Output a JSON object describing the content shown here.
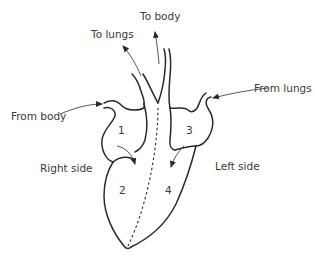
{
  "diagram": {
    "labels": {
      "to_body": "To body",
      "to_lungs": "To lungs",
      "from_body": "From body",
      "from_lungs": "From lungs",
      "right_side": "Right side",
      "left_side": "Left side"
    },
    "chambers": [
      {
        "id": "1",
        "label": "1"
      },
      {
        "id": "2",
        "label": "2"
      },
      {
        "id": "3",
        "label": "3"
      },
      {
        "id": "4",
        "label": "4"
      }
    ],
    "colors": {
      "stroke": "#2a2a2a",
      "arrow": "#555555",
      "text": "#3a3a3a"
    }
  }
}
